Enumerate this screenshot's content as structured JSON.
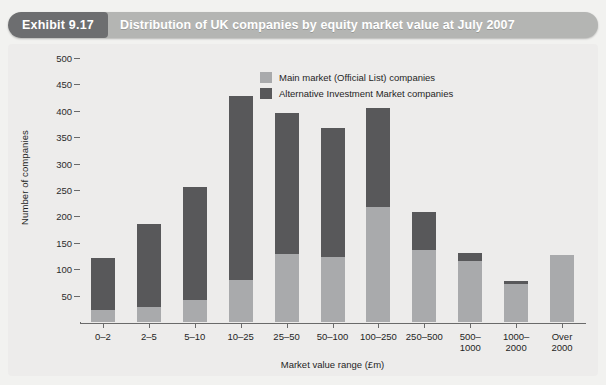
{
  "header": {
    "exhibit_tag": "Exhibit 9.17",
    "title": "Distribution of UK companies by equity market value at July 2007"
  },
  "chart_data": {
    "type": "bar",
    "stacked": true,
    "title": "Distribution of UK companies by equity market value at July 2007",
    "xlabel": "Market value range (£m)",
    "ylabel": "Number of companies",
    "ylim": [
      0,
      500
    ],
    "yticks": [
      50,
      100,
      150,
      200,
      250,
      300,
      350,
      400,
      450,
      500
    ],
    "grid": false,
    "legend_position": "top-right",
    "categories": [
      "0–2",
      "2–5",
      "5–10",
      "10–25",
      "25–50",
      "50–100",
      "100–250",
      "250–500",
      "500–\n1000",
      "1000–\n2000",
      "Over\n2000"
    ],
    "series": [
      {
        "name": "Main market (Official List) companies",
        "color": "#a9aaac",
        "values": [
          22,
          28,
          42,
          80,
          128,
          123,
          218,
          137,
          115,
          72,
          127
        ]
      },
      {
        "name": "Alternative Investment Market companies",
        "color": "#58585a",
        "values": [
          99,
          158,
          213,
          348,
          268,
          245,
          188,
          72,
          15,
          6,
          0
        ]
      }
    ],
    "totals": [
      121,
      186,
      255,
      428,
      396,
      368,
      406,
      209,
      130,
      78,
      127
    ]
  },
  "legend": {
    "items": [
      {
        "label": "Main market (Official List) companies",
        "swatch": "light-gray-swatch"
      },
      {
        "label": "Alternative Investment Market companies",
        "swatch": "dark-gray-swatch"
      }
    ]
  },
  "colors": {
    "header_band": "#b4b5b3",
    "header_tag": "#6d6e70",
    "plot_background": "#edeceb",
    "main_market": "#a9aaac",
    "aim": "#58585a",
    "axis": "#6a6a6a"
  }
}
